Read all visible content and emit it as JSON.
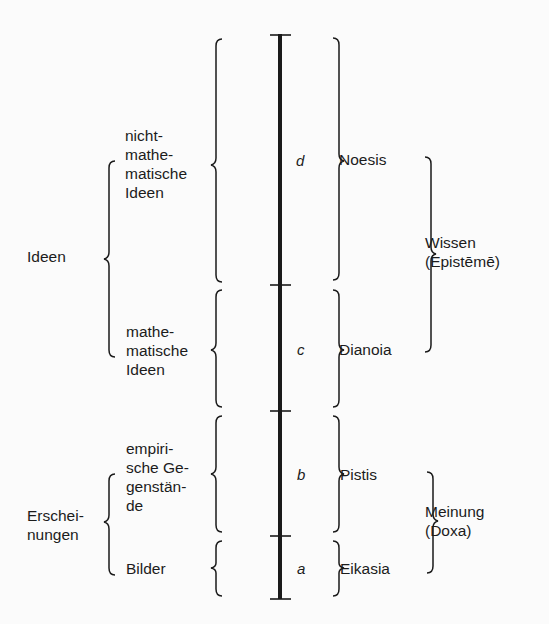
{
  "diagram": {
    "segments": [
      {
        "letter": "d",
        "object": "nicht-\nmathe-\nmatische\nIdeen",
        "faculty": "Noesis"
      },
      {
        "letter": "c",
        "object": "mathe-\nmatische\nIdeen",
        "faculty": "Dianoia"
      },
      {
        "letter": "b",
        "object": "empiri-\nsche Ge-\ngenstän-\nde",
        "faculty": "Pistis"
      },
      {
        "letter": "a",
        "object": "Bilder",
        "faculty": "Eikasia"
      }
    ],
    "left_groups": [
      {
        "label": "Ideen"
      },
      {
        "label": "Erschei-\nnungen"
      }
    ],
    "right_groups": [
      {
        "label": "Wissen\n(Epistēmē)"
      },
      {
        "label": "Meinung\n(Doxa)"
      }
    ],
    "colors": {
      "ink": "#1a1a1a",
      "background": "#fbfbfb"
    }
  }
}
